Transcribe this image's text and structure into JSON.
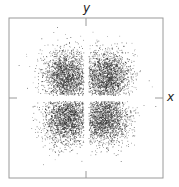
{
  "diagram": {
    "type": "dot-density-orbital",
    "axis_labels": {
      "x": "x",
      "y": "y"
    },
    "frame": {
      "left": 9,
      "top": 18,
      "right": 163,
      "bottom": 178
    },
    "origin": {
      "x": 86,
      "y": 98
    },
    "lobes": [
      {
        "cx": 67,
        "cy": 76,
        "quadrant": "upper-left"
      },
      {
        "cx": 106,
        "cy": 76,
        "quadrant": "upper-right"
      },
      {
        "cx": 67,
        "cy": 118,
        "quadrant": "lower-left"
      },
      {
        "cx": 104,
        "cy": 118,
        "quadrant": "lower-right"
      }
    ],
    "colors": {
      "frame": "#9a9a9a",
      "dots": "#222222",
      "background": "#ffffff"
    }
  }
}
